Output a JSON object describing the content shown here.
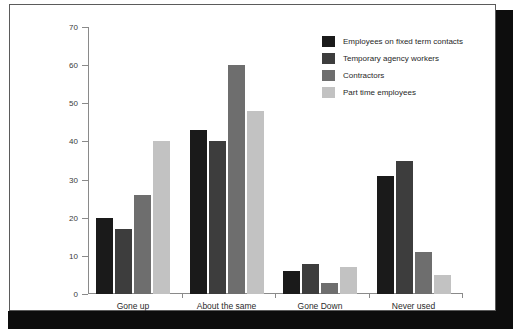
{
  "chart_data": {
    "type": "bar",
    "title": "",
    "xlabel": "",
    "ylabel": "",
    "ylim": [
      0,
      70
    ],
    "ytick_step": 10,
    "yticks": [
      0,
      10,
      20,
      30,
      40,
      50,
      60,
      70
    ],
    "grid": false,
    "legend_position": "top-right",
    "categories": [
      "Gone up",
      "About the same",
      "Gone Down",
      "Never used"
    ],
    "series": [
      {
        "name": "Employees on fixed term contacts",
        "color": "#1a1a1a",
        "values": [
          20,
          43,
          6,
          31
        ]
      },
      {
        "name": "Temporary agency workers",
        "color": "#3d3d3d",
        "values": [
          17,
          40,
          8,
          35
        ]
      },
      {
        "name": "Contractors",
        "color": "#6e6e6e",
        "values": [
          26,
          60,
          3,
          11
        ]
      },
      {
        "name": "Part time employees",
        "color": "#c2c2c2",
        "values": [
          40,
          48,
          7,
          5
        ]
      }
    ]
  },
  "style": {
    "frame_border_color": "#5b5b5b",
    "shadow_color": "#0d0d0d",
    "axis_color": "#8a8a8a",
    "background": "#ffffff"
  }
}
